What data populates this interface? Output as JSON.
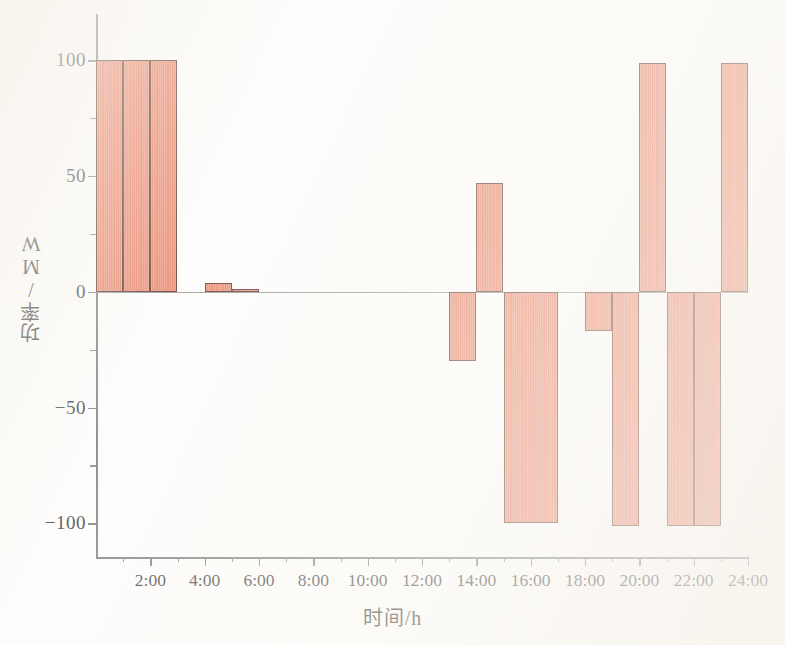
{
  "chart_data": {
    "type": "bar",
    "title": "",
    "xlabel": "时间/h",
    "ylabel": "功率/MW",
    "xlim": [
      0,
      24
    ],
    "ylim": [
      -115,
      120
    ],
    "grid": false,
    "legend": null,
    "x_tick_labels": [
      "2:00",
      "4:00",
      "6:00",
      "8:00",
      "10:00",
      "12:00",
      "14:00",
      "16:00",
      "18:00",
      "20:00",
      "22:00",
      "24:00"
    ],
    "x_tick_values": [
      2,
      4,
      6,
      8,
      10,
      12,
      14,
      16,
      18,
      20,
      22,
      24
    ],
    "x_minor_tick_values": [
      1,
      3,
      5,
      7,
      9,
      11,
      13,
      15,
      17,
      19,
      21,
      23
    ],
    "y_tick_labels": [
      "100",
      "50",
      "0",
      "-50",
      "-100"
    ],
    "y_tick_values": [
      100,
      50,
      0,
      -50,
      -100
    ],
    "y_minor_tick_values": [
      75,
      25,
      -25,
      -75
    ],
    "bar_fill_color": "#e8795a",
    "bar_edge_color": "#4a2218",
    "axis_color": "#6f6f6f",
    "categories": [
      1,
      2,
      3,
      4,
      5,
      6,
      7,
      8,
      9,
      10,
      11,
      12,
      13,
      14,
      15,
      16,
      17,
      18,
      19,
      20,
      21,
      22,
      23,
      24
    ],
    "values": [
      100,
      100,
      100,
      0,
      4,
      1,
      0,
      0,
      0,
      0,
      0,
      0,
      0,
      -30,
      47,
      -100,
      -100,
      0,
      -17,
      -101,
      99,
      -101,
      -101,
      99
    ],
    "bars": [
      {
        "hour_start": 0,
        "hour_end": 1,
        "value": 100
      },
      {
        "hour_start": 1,
        "hour_end": 2,
        "value": 100
      },
      {
        "hour_start": 2,
        "hour_end": 3,
        "value": 100
      },
      {
        "hour_start": 4,
        "hour_end": 5,
        "value": 4
      },
      {
        "hour_start": 5,
        "hour_end": 6,
        "value": 1
      },
      {
        "hour_start": 13,
        "hour_end": 14,
        "value": -30
      },
      {
        "hour_start": 14,
        "hour_end": 15,
        "value": 47
      },
      {
        "hour_start": 15,
        "hour_end": 17,
        "value": -100
      },
      {
        "hour_start": 18,
        "hour_end": 19,
        "value": -17
      },
      {
        "hour_start": 19,
        "hour_end": 20,
        "value": -101
      },
      {
        "hour_start": 20,
        "hour_end": 21,
        "value": 99
      },
      {
        "hour_start": 21,
        "hour_end": 22,
        "value": -101
      },
      {
        "hour_start": 22,
        "hour_end": 23,
        "value": -101
      },
      {
        "hour_start": 23,
        "hour_end": 24,
        "value": 99
      }
    ]
  }
}
